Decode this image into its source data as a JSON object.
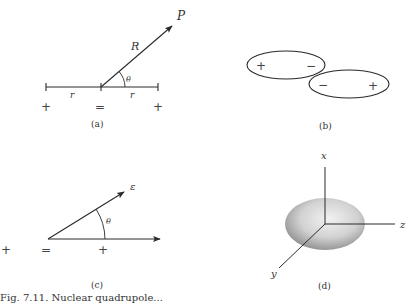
{
  "figure": {
    "panels": [
      {
        "id": "a",
        "label": "(a)",
        "description": "Linear quadrupole: charges + , = , + separated by distance r; field point P at distance R, angle theta",
        "labels": {
          "point": "P",
          "distance": "R",
          "angle": "θ",
          "left_sep": "r",
          "right_sep": "r"
        },
        "charges": [
          "+",
          "=",
          "+"
        ]
      },
      {
        "id": "b",
        "label": "(b)",
        "description": "Two overlapping ellipses each with + and − ends, arranged antiparallel",
        "ellipse_left": {
          "left_sign": "+",
          "right_sign": "−"
        },
        "ellipse_right": {
          "left_sign": "−",
          "right_sign": "+"
        }
      },
      {
        "id": "c",
        "label": "(c)",
        "description": "Field vector ε at angle θ from axis; charges +, =, +",
        "labels": {
          "field": "ε",
          "angle": "θ"
        },
        "charges": [
          "+",
          "=",
          "+"
        ]
      },
      {
        "id": "d",
        "label": "(d)",
        "description": "Shaded oblate ellipsoid with x, y, z axes",
        "axes": {
          "vertical": "x",
          "horizontal": "z",
          "diagonal": "y"
        }
      }
    ],
    "caption_partial": "Fig. 7.11. Nuclear quadrupole..."
  },
  "colors": {
    "line": "#2a2a2a",
    "background": "#ffffff",
    "ellipsoid_light": "#e6e6e6",
    "ellipsoid_dark": "#8a8a8a"
  }
}
